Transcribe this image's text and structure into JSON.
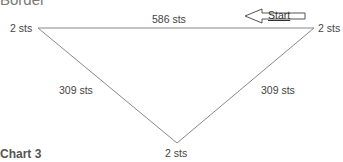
{
  "section_title": "Border",
  "chart_label": "Chart 3",
  "diagram": {
    "shape": "inverted-triangle",
    "start_label": "Start",
    "top_edge": {
      "label": "586 sts"
    },
    "left_edge": {
      "label": "309 sts"
    },
    "right_edge": {
      "label": "309 sts"
    },
    "corners": {
      "top_left": "2 sts",
      "top_right": "2 sts",
      "bottom": "2 sts"
    },
    "line_color": "#888888"
  }
}
